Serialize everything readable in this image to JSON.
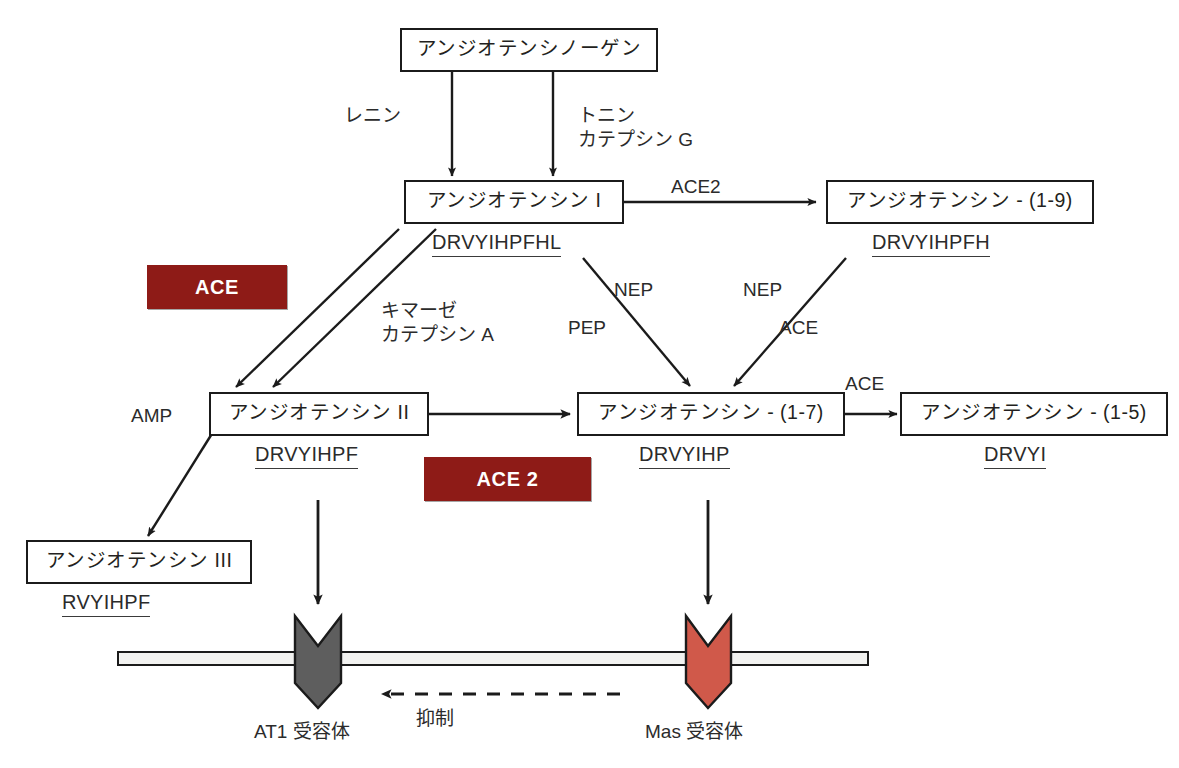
{
  "diagram": {
    "background_color": "#ffffff",
    "line_color": "#1b1b1b",
    "ace_chip_color": "#8E1B17",
    "ace2_chip_color": "#8E1B17",
    "at1_receptor_color": "#5E5E5E",
    "mas_receptor_color": "#D0594A"
  },
  "nodes": {
    "angiotensinogen": {
      "label": "アンジオテンシノーゲン"
    },
    "angiotensin_1": {
      "label": "アンジオテンシン I",
      "sequence": "DRVYIHPFHL"
    },
    "angiotensin_1_9": {
      "label": "アンジオテンシン - (1-9)",
      "sequence": "DRVYIHPFH"
    },
    "angiotensin_2": {
      "label": "アンジオテンシン II",
      "sequence": "DRVYIHPF"
    },
    "angiotensin_1_7": {
      "label": "アンジオテンシン - (1-7)",
      "sequence": "DRVYIHP"
    },
    "angiotensin_1_5": {
      "label": "アンジオテンシン - (1-5)",
      "sequence": "DRVYI"
    },
    "angiotensin_3": {
      "label": "アンジオテンシン III",
      "sequence": "RVYIHPF"
    }
  },
  "enzymes": {
    "renin": "レニン",
    "tonin_cathepsin_g_line1": "トニン",
    "tonin_cathepsin_g_line2": "カテプシン G",
    "ace2_top": "ACE2",
    "chymase_line1": "キマーゼ",
    "chymase_line2": "カテプシン A",
    "nep_left": "NEP",
    "pep_left": "PEP",
    "nep_right": "NEP",
    "ace_right": "ACE",
    "ace_1_5": "ACE",
    "amp": "AMP"
  },
  "chips": {
    "ace": "ACE",
    "ace2": "ACE 2"
  },
  "receptors": {
    "at1": "AT1 受容体",
    "mas": "Mas 受容体",
    "inhibition": "抑制"
  }
}
